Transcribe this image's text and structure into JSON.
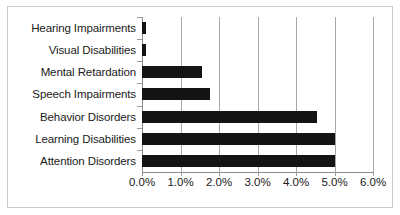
{
  "chart_data": {
    "type": "bar",
    "orientation": "horizontal",
    "title": "",
    "subtitle": "",
    "xlabel": "",
    "ylabel": "",
    "categories": [
      "Hearing Impairments",
      "Visual Disabilities",
      "Mental Retardation",
      "Speech Impairments",
      "Behavior Disorders",
      "Learning Disabilities",
      "Attention Disorders"
    ],
    "values": [
      0.1,
      0.1,
      1.55,
      1.77,
      4.55,
      5.0,
      5.0
    ],
    "value_labels": [
      "0.1%",
      "0.1%",
      "1.55%",
      "1.77%",
      "4.55%",
      "5.0%",
      "5.0%"
    ],
    "xlim": [
      0.0,
      6.0
    ],
    "xticks": [
      0.0,
      1.0,
      2.0,
      3.0,
      4.0,
      5.0,
      6.0
    ],
    "xtick_labels": [
      "0.0%",
      "1.0%",
      "2.0%",
      "3.0%",
      "4.0%",
      "5.0%",
      "6.0%"
    ],
    "grid": "vertical",
    "legend": "none",
    "bar_color": "#141414",
    "gridline_color": "#a6a6a6",
    "axis_color": "#8a8a8a",
    "border_color": "#c9c9c9",
    "background_color": "#ffffff",
    "text_color": "#1a1a1a"
  }
}
